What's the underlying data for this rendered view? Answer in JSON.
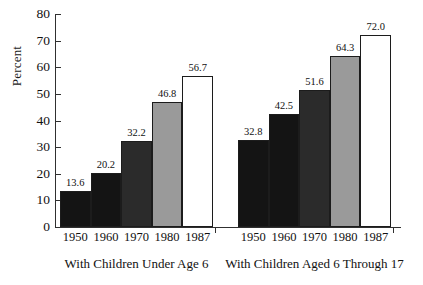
{
  "chart_data": {
    "type": "bar",
    "title": "",
    "xlabel": "",
    "ylabel": "Percent",
    "ylim": [
      0,
      80
    ],
    "ytick_step": 10,
    "yticks": [
      "80",
      "70",
      "60",
      "50",
      "40",
      "30",
      "20",
      "10",
      "0"
    ],
    "grid": false,
    "legend": "none",
    "categories": [
      "1950",
      "1960",
      "1970",
      "1980",
      "1987"
    ],
    "groups": [
      {
        "name": "With Children Under Age 6",
        "categories": [
          "1950",
          "1960",
          "1970",
          "1980",
          "1987"
        ],
        "values": [
          13.6,
          20.2,
          32.2,
          46.8,
          56.7
        ],
        "value_labels": [
          "13.6",
          "20.2",
          "32.2",
          "46.8",
          "56.7"
        ],
        "bar_colors": [
          "#141414",
          "#141414",
          "#2b2b2b",
          "#9a9a9a",
          "#ffffff"
        ]
      },
      {
        "name": "With Children Aged 6 Through 17",
        "categories": [
          "1950",
          "1960",
          "1970",
          "1980",
          "1987"
        ],
        "values": [
          32.8,
          42.5,
          51.6,
          64.3,
          72.0
        ],
        "value_labels": [
          "32.8",
          "42.5",
          "51.6",
          "64.3",
          "72.0"
        ],
        "bar_colors": [
          "#141414",
          "#141414",
          "#2b2b2b",
          "#9a9a9a",
          "#ffffff"
        ]
      }
    ],
    "colors": {
      "axis": "#303030",
      "text": "#111111",
      "bar_outline": "#1c1c1c",
      "background": "#ffffff"
    }
  }
}
